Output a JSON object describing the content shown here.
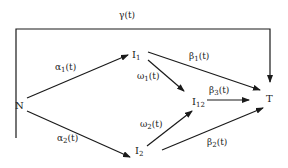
{
  "diagram": {
    "type": "state-transition",
    "nodes": [
      {
        "id": "N",
        "label": "N",
        "sub": ""
      },
      {
        "id": "I1",
        "label": "I",
        "sub": "1"
      },
      {
        "id": "I2",
        "label": "I",
        "sub": "2"
      },
      {
        "id": "I12",
        "label": "I",
        "sub": "12"
      },
      {
        "id": "T",
        "label": "T",
        "sub": ""
      }
    ],
    "edges": [
      {
        "from": "N",
        "to": "T",
        "greek": "γ",
        "sub": "",
        "arg": "(t)"
      },
      {
        "from": "N",
        "to": "I1",
        "greek": "α",
        "sub": "1",
        "arg": "(t)"
      },
      {
        "from": "N",
        "to": "I2",
        "greek": "α",
        "sub": "2",
        "arg": "(t)"
      },
      {
        "from": "I1",
        "to": "T",
        "greek": "β",
        "sub": "1",
        "arg": "(t)"
      },
      {
        "from": "I1",
        "to": "I12",
        "greek": "ω",
        "sub": "1",
        "arg": "(t)"
      },
      {
        "from": "I2",
        "to": "I12",
        "greek": "ω",
        "sub": "2",
        "arg": "(t)"
      },
      {
        "from": "I12",
        "to": "T",
        "greek": "β",
        "sub": "3",
        "arg": "(t)"
      },
      {
        "from": "I2",
        "to": "T",
        "greek": "β",
        "sub": "2",
        "arg": "(t)"
      }
    ]
  }
}
